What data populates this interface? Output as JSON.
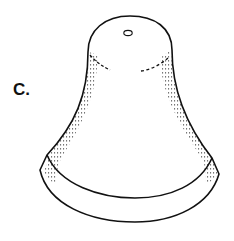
{
  "figure": {
    "label": "C.",
    "colors": {
      "line": "#111111",
      "background": "#ffffff",
      "stipple": "#555555"
    }
  }
}
